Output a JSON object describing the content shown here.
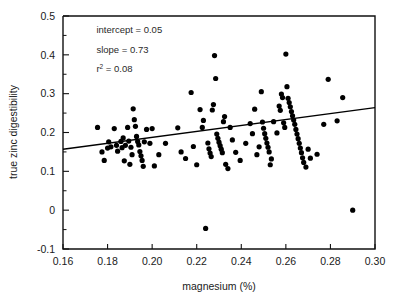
{
  "chart_data": {
    "type": "scatter",
    "title": "",
    "xlabel": "magnesium (%)",
    "ylabel": "true zinc digestibility",
    "xlim": [
      0.16,
      0.3
    ],
    "ylim": [
      -0.1,
      0.5
    ],
    "xticks": [
      0.16,
      0.18,
      0.2,
      0.22,
      0.24,
      0.26,
      0.28,
      0.3
    ],
    "xtick_labels": [
      "0.16",
      "0.18",
      "0.20",
      "0.22",
      "0.24",
      "0.26",
      "0.28",
      "0.30"
    ],
    "yticks": [
      -0.1,
      0,
      0.1,
      0.2,
      0.3,
      0.4,
      0.5
    ],
    "ytick_labels": [
      "-0.1",
      "0",
      "0.1",
      "0.2",
      "0.3",
      "0.4",
      "0.5"
    ],
    "y_minor_ticks": [
      -0.05,
      0.05,
      0.15,
      0.25,
      0.35,
      0.45
    ],
    "grid": false,
    "legend": "none",
    "annotations": [
      {
        "id": "intercept",
        "label": "intercept = 0.05",
        "x": 0.175,
        "y": 0.455
      },
      {
        "id": "slope",
        "label": "slope = 0.73",
        "x": 0.175,
        "y": 0.405
      },
      {
        "id": "r2",
        "label": "r",
        "sup": "2",
        "suffix": " = 0.08",
        "x": 0.175,
        "y": 0.355
      }
    ],
    "fit_line": {
      "name": "least-squares regression",
      "intercept": 0.05,
      "slope": 0.73,
      "r_squared": 0.08,
      "x_start": 0.16,
      "x_end": 0.3,
      "y_start": 0.157,
      "y_end": 0.264
    },
    "series": [
      {
        "name": "observations",
        "marker": "filled-circle",
        "color": "#000000",
        "points": [
          [
            0.1755,
            0.213
          ],
          [
            0.1775,
            0.15
          ],
          [
            0.1785,
            0.128
          ],
          [
            0.18,
            0.16
          ],
          [
            0.1805,
            0.176
          ],
          [
            0.1815,
            0.163
          ],
          [
            0.183,
            0.21
          ],
          [
            0.184,
            0.167
          ],
          [
            0.1845,
            0.152
          ],
          [
            0.186,
            0.177
          ],
          [
            0.1865,
            0.161
          ],
          [
            0.187,
            0.186
          ],
          [
            0.1875,
            0.127
          ],
          [
            0.188,
            0.167
          ],
          [
            0.189,
            0.213
          ],
          [
            0.1895,
            0.178
          ],
          [
            0.19,
            0.118
          ],
          [
            0.1905,
            0.162
          ],
          [
            0.191,
            0.143
          ],
          [
            0.1915,
            0.261
          ],
          [
            0.192,
            0.233
          ],
          [
            0.1925,
            0.216
          ],
          [
            0.193,
            0.19
          ],
          [
            0.1935,
            0.177
          ],
          [
            0.194,
            0.168
          ],
          [
            0.1945,
            0.151
          ],
          [
            0.195,
            0.14
          ],
          [
            0.1955,
            0.128
          ],
          [
            0.196,
            0.113
          ],
          [
            0.1965,
            0.176
          ],
          [
            0.1975,
            0.208
          ],
          [
            0.199,
            0.172
          ],
          [
            0.2,
            0.21
          ],
          [
            0.201,
            0.114
          ],
          [
            0.203,
            0.143
          ],
          [
            0.206,
            0.172
          ],
          [
            0.2115,
            0.212
          ],
          [
            0.213,
            0.15
          ],
          [
            0.215,
            0.133
          ],
          [
            0.2175,
            0.303
          ],
          [
            0.2185,
            0.164
          ],
          [
            0.22,
            0.117
          ],
          [
            0.2215,
            0.259
          ],
          [
            0.2225,
            0.213
          ],
          [
            0.223,
            0.231
          ],
          [
            0.224,
            -0.047
          ],
          [
            0.225,
            0.173
          ],
          [
            0.2255,
            0.158
          ],
          [
            0.226,
            0.147
          ],
          [
            0.2265,
            0.138
          ],
          [
            0.227,
            0.258
          ],
          [
            0.2275,
            0.272
          ],
          [
            0.228,
            0.398
          ],
          [
            0.2285,
            0.339
          ],
          [
            0.229,
            0.196
          ],
          [
            0.2295,
            0.185
          ],
          [
            0.23,
            0.175
          ],
          [
            0.2305,
            0.166
          ],
          [
            0.231,
            0.157
          ],
          [
            0.2315,
            0.148
          ],
          [
            0.232,
            0.228
          ],
          [
            0.2325,
            0.241
          ],
          [
            0.233,
            0.118
          ],
          [
            0.234,
            0.107
          ],
          [
            0.235,
            0.213
          ],
          [
            0.236,
            0.181
          ],
          [
            0.2375,
            0.149
          ],
          [
            0.2395,
            0.128
          ],
          [
            0.242,
            0.172
          ],
          [
            0.244,
            0.223
          ],
          [
            0.245,
            0.197
          ],
          [
            0.246,
            0.26
          ],
          [
            0.247,
            0.143
          ],
          [
            0.248,
            0.163
          ],
          [
            0.249,
            0.305
          ],
          [
            0.2495,
            0.227
          ],
          [
            0.25,
            0.211
          ],
          [
            0.2505,
            0.197
          ],
          [
            0.251,
            0.185
          ],
          [
            0.2515,
            0.173
          ],
          [
            0.252,
            0.162
          ],
          [
            0.2525,
            0.15
          ],
          [
            0.253,
            0.117
          ],
          [
            0.2535,
            0.132
          ],
          [
            0.2545,
            0.228
          ],
          [
            0.256,
            0.199
          ],
          [
            0.257,
            0.268
          ],
          [
            0.2575,
            0.257
          ],
          [
            0.258,
            0.299
          ],
          [
            0.2585,
            0.29
          ],
          [
            0.259,
            0.225
          ],
          [
            0.2595,
            0.213
          ],
          [
            0.26,
            0.402
          ],
          [
            0.2605,
            0.318
          ],
          [
            0.261,
            0.288
          ],
          [
            0.2615,
            0.277
          ],
          [
            0.262,
            0.266
          ],
          [
            0.2625,
            0.254
          ],
          [
            0.263,
            0.243
          ],
          [
            0.2635,
            0.232
          ],
          [
            0.264,
            0.221
          ],
          [
            0.2645,
            0.208
          ],
          [
            0.265,
            0.196
          ],
          [
            0.2655,
            0.184
          ],
          [
            0.266,
            0.172
          ],
          [
            0.2665,
            0.16
          ],
          [
            0.267,
            0.148
          ],
          [
            0.2675,
            0.135
          ],
          [
            0.268,
            0.123
          ],
          [
            0.269,
            0.111
          ],
          [
            0.27,
            0.157
          ],
          [
            0.271,
            0.134
          ],
          [
            0.274,
            0.144
          ],
          [
            0.277,
            0.221
          ],
          [
            0.279,
            0.337
          ],
          [
            0.283,
            0.23
          ],
          [
            0.2855,
            0.29
          ],
          [
            0.29,
            0.0
          ]
        ]
      }
    ]
  }
}
